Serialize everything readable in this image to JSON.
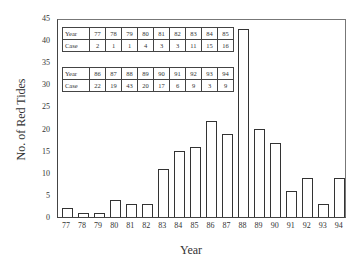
{
  "chart_data": {
    "type": "bar",
    "title": "",
    "xlabel": "Year",
    "ylabel": "No. of Red Tides",
    "ylim": [
      0,
      45
    ],
    "yticks": [
      0,
      5,
      10,
      15,
      20,
      25,
      30,
      35,
      40,
      45
    ],
    "grid": false,
    "legend": null,
    "categories": [
      "77",
      "78",
      "79",
      "80",
      "81",
      "82",
      "83",
      "84",
      "85",
      "86",
      "87",
      "88",
      "89",
      "90",
      "91",
      "92",
      "93",
      "94"
    ],
    "values": [
      2,
      1,
      1,
      4,
      3,
      3,
      11,
      15,
      16,
      22,
      19,
      43,
      20,
      17,
      6,
      9,
      3,
      9
    ],
    "inset_tables": [
      {
        "header_row": "Year",
        "value_row": "Case",
        "years": [
          "77",
          "78",
          "79",
          "80",
          "81",
          "82",
          "83",
          "84",
          "85"
        ],
        "cases": [
          "2",
          "1",
          "1",
          "4",
          "3",
          "3",
          "11",
          "15",
          "16"
        ]
      },
      {
        "header_row": "Year",
        "value_row": "Case",
        "years": [
          "86",
          "87",
          "88",
          "89",
          "90",
          "91",
          "92",
          "93",
          "94"
        ],
        "cases": [
          "22",
          "19",
          "43",
          "20",
          "17",
          "6",
          "9",
          "3",
          "9"
        ]
      }
    ]
  },
  "axis": {
    "ylabel": "No. of Red Tides",
    "xlabel": "Year",
    "yticks": [
      "0",
      "5",
      "10",
      "15",
      "20",
      "25",
      "30",
      "35",
      "40",
      "45"
    ]
  }
}
